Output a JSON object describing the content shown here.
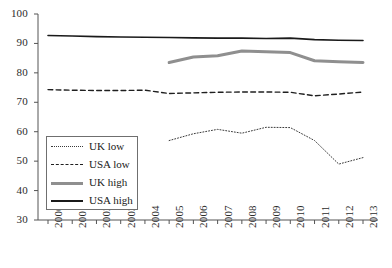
{
  "chart_data": {
    "type": "line",
    "title": "",
    "subtitle": "",
    "xlabel": "",
    "ylabel": "",
    "xlim": [
      2000,
      2013
    ],
    "ylim": [
      30,
      100
    ],
    "ytick_step": 10,
    "grid": false,
    "legend_position": "inside-lower-left",
    "categories": [
      2000,
      2001,
      2002,
      2003,
      2004,
      2005,
      2006,
      2007,
      2008,
      2009,
      2010,
      2011,
      2012,
      2013
    ],
    "x_tick_labels": [
      "2000",
      "2001",
      "2002",
      "2003",
      "2004",
      "2005",
      "2006",
      "2007",
      "2008",
      "2009",
      "2010",
      "2011",
      "2012",
      "2013"
    ],
    "y_tick_labels": [
      "30",
      "40",
      "50",
      "60",
      "70",
      "80",
      "90",
      "100"
    ],
    "y_tick_values": [
      30,
      40,
      50,
      60,
      70,
      80,
      90,
      100
    ],
    "series": [
      {
        "name": "UK low",
        "style": "dotted",
        "color": "#3a3a3a",
        "width": 1,
        "x": [
          2005,
          2006,
          2007,
          2008,
          2009,
          2010,
          2011,
          2012,
          2013
        ],
        "values": [
          57.0,
          59.3,
          60.8,
          59.5,
          61.5,
          61.4,
          57.0,
          49.0,
          51.2
        ]
      },
      {
        "name": "USA low",
        "style": "dashed",
        "color": "#1f1f1f",
        "width": 1.4,
        "x": [
          2000,
          2001,
          2002,
          2003,
          2004,
          2005,
          2006,
          2007,
          2008,
          2009,
          2010,
          2011,
          2012,
          2013
        ],
        "values": [
          74.3,
          74.1,
          74.0,
          74.0,
          74.1,
          73.0,
          73.2,
          73.4,
          73.5,
          73.5,
          73.4,
          72.2,
          72.8,
          73.5
        ]
      },
      {
        "name": "UK high",
        "style": "solid",
        "color": "#8f8f8f",
        "width": 3,
        "x": [
          2005,
          2006,
          2007,
          2008,
          2009,
          2010,
          2011,
          2012,
          2013
        ],
        "values": [
          83.5,
          85.4,
          85.8,
          87.4,
          87.2,
          86.9,
          84.1,
          83.8,
          83.5
        ]
      },
      {
        "name": "USA high",
        "style": "solid",
        "color": "#1a1a1a",
        "width": 1.6,
        "x": [
          2000,
          2001,
          2002,
          2003,
          2004,
          2005,
          2006,
          2007,
          2008,
          2009,
          2010,
          2011,
          2012,
          2013
        ],
        "values": [
          92.7,
          92.5,
          92.3,
          92.2,
          92.1,
          92.0,
          91.9,
          91.8,
          91.8,
          91.7,
          91.8,
          91.3,
          91.1,
          91.0
        ]
      }
    ]
  },
  "legend": {
    "items": [
      {
        "label": "UK low"
      },
      {
        "label": "USA low"
      },
      {
        "label": "UK high"
      },
      {
        "label": "USA high"
      }
    ]
  }
}
